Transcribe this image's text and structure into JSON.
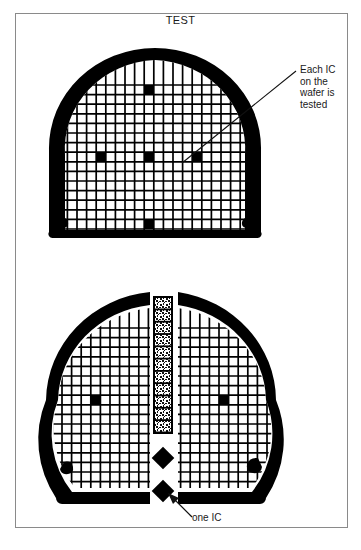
{
  "figure": {
    "title": "TEST",
    "background_color": "#ffffff",
    "frame_color": "#8a8a8a",
    "ink_color": "#000000"
  },
  "annotations": [
    {
      "id": "each-ic-tested",
      "text": "Each IC\non the\nwafer is\ntested",
      "points_to": "top-wafer-die"
    },
    {
      "id": "one-ic",
      "text": "one IC",
      "points_to": "lower-diamond-die"
    }
  ],
  "diagram": {
    "type": "semiconductor-wafer-test-illustration",
    "top_wafer": {
      "label": "whole wafer with probe grid",
      "shape": "circle-with-flat-bottom",
      "cx": 155,
      "cy": 148,
      "rx": 102,
      "ry": 96,
      "flat_bottom_y": 238,
      "grid": {
        "cell_size": 9.6,
        "line_width": 1.6,
        "origin_x": 56,
        "origin_y": 85,
        "cols": 21,
        "rows": 16
      },
      "marked_dies": [
        {
          "col": 9,
          "row": 0
        },
        {
          "col": 4,
          "row": 7
        },
        {
          "col": 9,
          "row": 7
        },
        {
          "col": 14,
          "row": 7
        },
        {
          "col": 9,
          "row": 15
        }
      ],
      "notches": [
        "lower-left",
        "lower-right"
      ]
    },
    "bottom_wafer": {
      "label": "wafer split into halves with extracted die column",
      "shape": "circle-with-flat-bottom-split",
      "cx": 160,
      "cy": 400,
      "rx": 112,
      "ry": 105,
      "split_gap_x": [
        148,
        180
      ],
      "left_half": {
        "grid": {
          "cell_size": 9.6,
          "origin_x": 48,
          "origin_y": 328,
          "cols": 10,
          "rows": 16
        },
        "marked_dies": [
          {
            "col": 5,
            "row": 7
          }
        ]
      },
      "right_half": {
        "grid": {
          "cell_size": 9.6,
          "origin_x": 182,
          "origin_y": 328,
          "cols": 10,
          "rows": 16
        },
        "marked_dies": [
          {
            "col": 4,
            "row": 7
          }
        ]
      },
      "notches": [
        "lower-left",
        "lower-right"
      ]
    },
    "die_strip": {
      "label": "vertical column of singulated IC dies",
      "x": 154,
      "y": 297,
      "width": 18,
      "height": 136,
      "die_count": 11
    },
    "loose_dies": [
      {
        "id": "upper-diamond-die",
        "cx": 163,
        "cy": 458,
        "size": 9
      },
      {
        "id": "lower-diamond-die",
        "cx": 163,
        "cy": 491,
        "size": 9
      }
    ]
  }
}
